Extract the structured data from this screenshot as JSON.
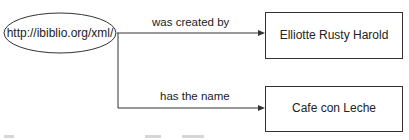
{
  "diagram": {
    "type": "rdf-graph",
    "nodes": [
      {
        "id": "resource",
        "shape": "ellipse",
        "label": "http://ibiblio.org/xml/"
      },
      {
        "id": "author",
        "shape": "rectangle",
        "label": "Elliotte Rusty Harold"
      },
      {
        "id": "name",
        "shape": "rectangle",
        "label": "Cafe con Leche"
      }
    ],
    "edges": [
      {
        "from": "resource",
        "to": "author",
        "label": "was created by"
      },
      {
        "from": "resource",
        "to": "name",
        "label": "has the name"
      }
    ]
  },
  "colors": {
    "stroke": "#333333",
    "text": "#222222",
    "background": "#ffffff"
  }
}
